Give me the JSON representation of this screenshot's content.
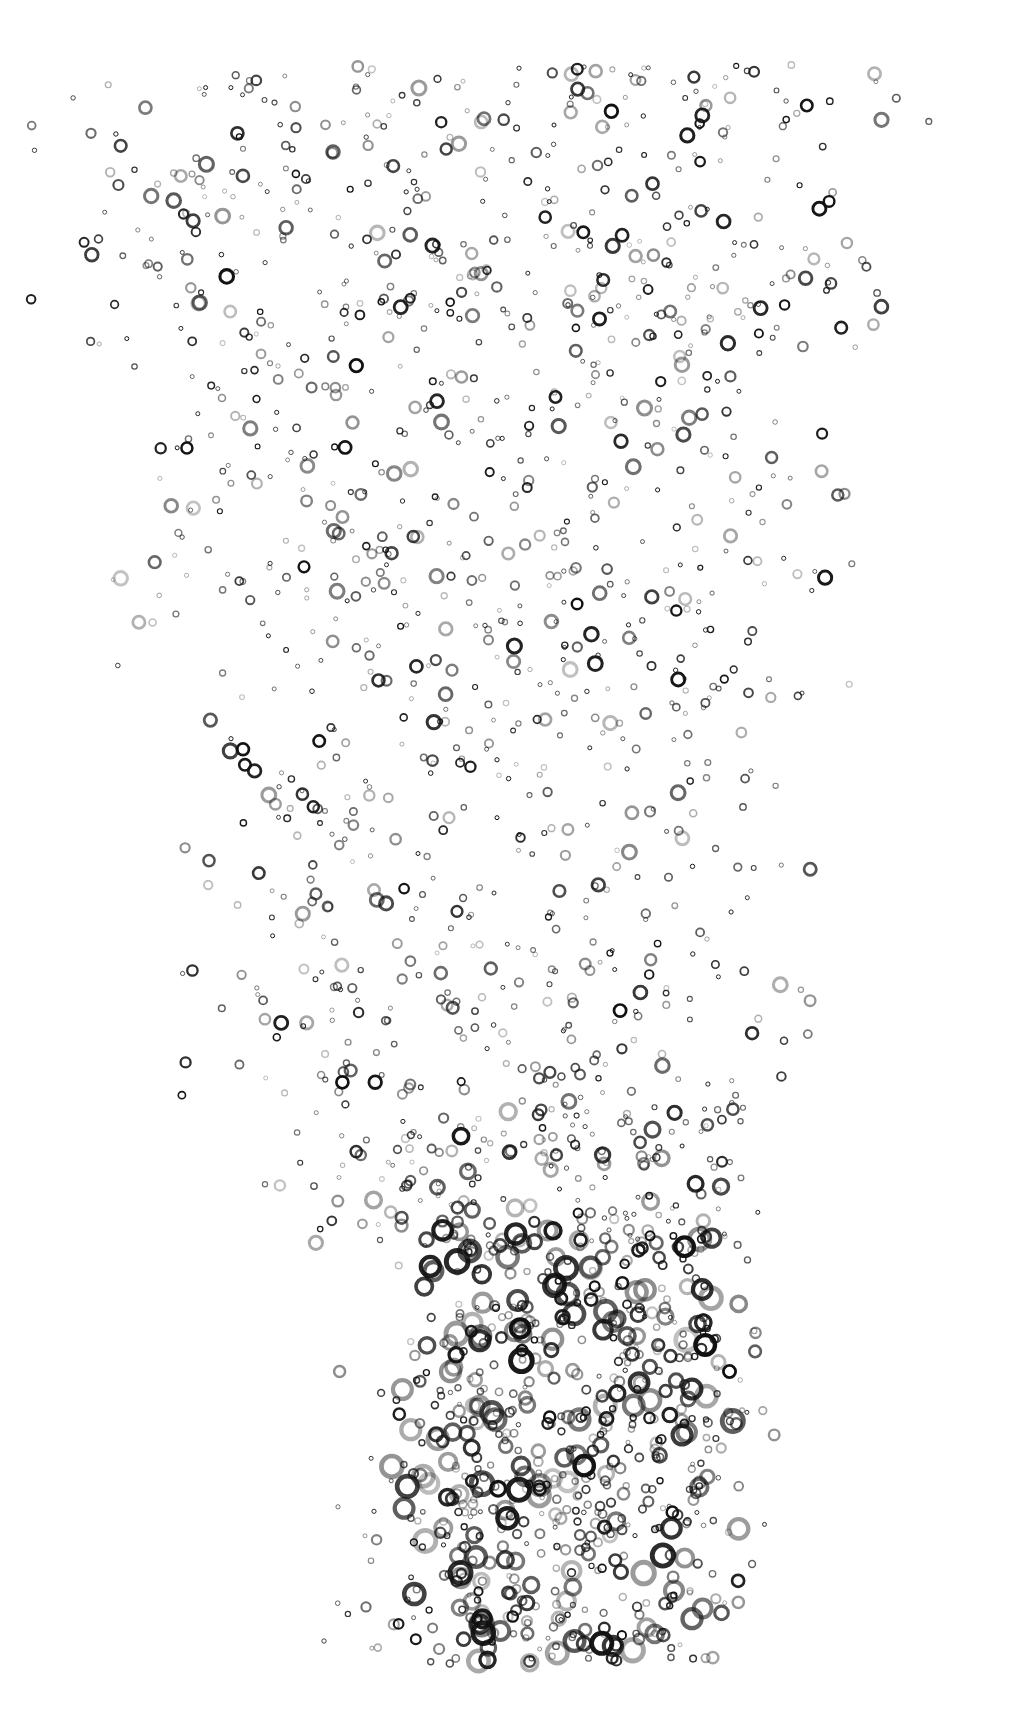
{
  "image": {
    "subject": "bubbles rising in water",
    "background": "#ffffff",
    "bubble_color": "#111111",
    "width": 1020,
    "height": 1728
  },
  "bubble_field": {
    "seed": 7,
    "bands": [
      {
        "y0": 65,
        "y1": 360,
        "x0": 150,
        "x1": 800,
        "count": 420,
        "rmin": 2,
        "rmax": 7
      },
      {
        "y0": 360,
        "y1": 700,
        "x0": 190,
        "x1": 760,
        "count": 380,
        "rmin": 2,
        "rmax": 7
      },
      {
        "y0": 700,
        "y1": 1100,
        "x0": 260,
        "x1": 740,
        "count": 340,
        "rmin": 2,
        "rmax": 7
      },
      {
        "y0": 1100,
        "y1": 1250,
        "x0": 340,
        "x1": 720,
        "count": 200,
        "rmin": 2,
        "rmax": 8
      },
      {
        "y0": 1230,
        "y1": 1665,
        "x0": 440,
        "x1": 700,
        "count": 520,
        "rmin": 3,
        "rmax": 11
      },
      {
        "y0": 1300,
        "y1": 1660,
        "x0": 360,
        "x1": 740,
        "count": 160,
        "rmin": 2,
        "rmax": 6
      }
    ]
  }
}
